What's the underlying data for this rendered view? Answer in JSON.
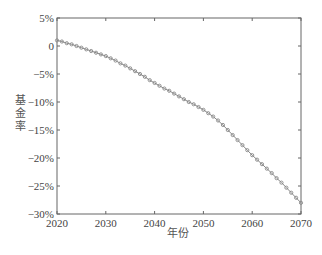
{
  "chart_data": {
    "type": "line",
    "title": "",
    "xlabel": "年份",
    "ylabel": "基金率",
    "xlim": [
      2020,
      2070
    ],
    "ylim": [
      -30,
      5
    ],
    "x_ticks": [
      2020,
      2030,
      2040,
      2050,
      2060,
      2070
    ],
    "x_tick_labels": [
      "2020",
      "2030",
      "2040",
      "2050",
      "2060",
      "2070"
    ],
    "y_ticks": [
      5,
      0,
      -5,
      -10,
      -15,
      -20,
      -25,
      -30
    ],
    "y_tick_labels": [
      "5%",
      "0",
      "-5%",
      "-10%",
      "-15%",
      "-20%",
      "-25%",
      "-30%"
    ],
    "grid": false,
    "legend": null,
    "marker": "circle",
    "series": [
      {
        "name": "基金率",
        "color": "#888888",
        "x": [
          2020,
          2021,
          2022,
          2023,
          2024,
          2025,
          2026,
          2027,
          2028,
          2029,
          2030,
          2031,
          2032,
          2033,
          2034,
          2035,
          2036,
          2037,
          2038,
          2039,
          2040,
          2041,
          2042,
          2043,
          2044,
          2045,
          2046,
          2047,
          2048,
          2049,
          2050,
          2051,
          2052,
          2053,
          2054,
          2055,
          2056,
          2057,
          2058,
          2059,
          2060,
          2061,
          2062,
          2063,
          2064,
          2065,
          2066,
          2067,
          2068,
          2069,
          2070
        ],
        "values": [
          1.0,
          0.8,
          0.5,
          0.3,
          0.0,
          -0.3,
          -0.6,
          -0.9,
          -1.2,
          -1.5,
          -1.8,
          -2.2,
          -2.6,
          -3.1,
          -3.5,
          -4.0,
          -4.5,
          -5.0,
          -5.5,
          -6.1,
          -6.6,
          -7.1,
          -7.6,
          -8.0,
          -8.5,
          -9.0,
          -9.5,
          -10.0,
          -10.4,
          -10.9,
          -11.4,
          -12.0,
          -12.6,
          -13.3,
          -14.1,
          -15.0,
          -15.9,
          -16.8,
          -17.7,
          -18.6,
          -19.5,
          -20.3,
          -21.1,
          -21.9,
          -22.7,
          -23.6,
          -24.4,
          -25.3,
          -26.2,
          -27.1,
          -28.0
        ]
      }
    ]
  }
}
